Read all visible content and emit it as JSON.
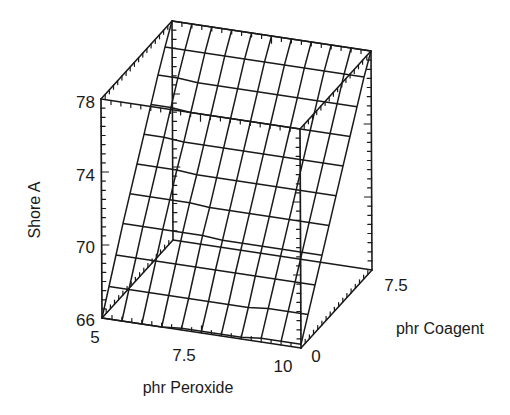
{
  "chart_data": {
    "type": "surface3d",
    "title": "",
    "xlabel": "phr Peroxide",
    "ylabel": "phr Coagent",
    "zlabel": "Shore A",
    "x_ticks": [
      "5",
      "7.5",
      "10"
    ],
    "y_ticks": [
      "0",
      "7.5"
    ],
    "z_ticks": [
      "66",
      "70",
      "74",
      "78"
    ],
    "xlim": [
      5,
      10
    ],
    "ylim": [
      0,
      8.5
    ],
    "zlim": [
      66,
      78
    ],
    "grid": {
      "nx": 10,
      "ny": 10
    },
    "x": [
      5.0,
      5.5,
      6.0,
      6.5,
      7.0,
      7.5,
      8.0,
      8.5,
      9.0,
      9.5,
      10.0
    ],
    "y": [
      0.0,
      0.85,
      1.7,
      2.55,
      3.4,
      4.25,
      5.1,
      5.95,
      6.8,
      7.65,
      8.5
    ],
    "z_description": "Shore A hardness surface; near-planar, rising from ~66 at coagent 0 to ~78 at max coagent, nearly flat across peroxide",
    "z_rows_by_coagent": [
      [
        66.0,
        66.0,
        66.0,
        66.0,
        66.1,
        66.1,
        66.1,
        66.1,
        66.2,
        66.2,
        66.2
      ],
      [
        67.3,
        67.3,
        67.3,
        67.3,
        67.3,
        67.3,
        67.3,
        67.3,
        67.4,
        67.4,
        67.4
      ],
      [
        68.6,
        68.6,
        68.6,
        68.6,
        68.6,
        68.6,
        68.6,
        68.6,
        68.6,
        68.6,
        68.6
      ],
      [
        69.9,
        69.9,
        69.9,
        69.9,
        69.9,
        69.8,
        69.8,
        69.8,
        69.8,
        69.8,
        69.8
      ],
      [
        71.1,
        71.1,
        71.1,
        71.1,
        71.0,
        71.0,
        71.0,
        71.0,
        71.0,
        71.0,
        71.0
      ],
      [
        72.3,
        72.3,
        72.3,
        72.2,
        72.2,
        72.2,
        72.2,
        72.2,
        72.2,
        72.2,
        72.2
      ],
      [
        73.5,
        73.5,
        73.4,
        73.4,
        73.4,
        73.4,
        73.4,
        73.4,
        73.4,
        73.4,
        73.4
      ],
      [
        74.7,
        74.7,
        74.6,
        74.6,
        74.6,
        74.6,
        74.6,
        74.6,
        74.6,
        74.6,
        74.6
      ],
      [
        75.9,
        75.9,
        75.8,
        75.8,
        75.8,
        75.8,
        75.8,
        75.8,
        75.8,
        75.8,
        75.8
      ],
      [
        77.0,
        77.0,
        77.0,
        77.0,
        77.0,
        77.0,
        77.0,
        77.0,
        77.0,
        77.0,
        77.0
      ],
      [
        78.0,
        78.0,
        78.0,
        78.0,
        78.0,
        78.0,
        78.0,
        78.0,
        78.0,
        78.0,
        78.0
      ]
    ],
    "box": true,
    "legend": null
  },
  "labels": {
    "z_axis_title": "Shore A",
    "x_axis_title": "phr Peroxide",
    "y_axis_title": "phr Coagent",
    "z_tick_0": "66",
    "z_tick_1": "70",
    "z_tick_2": "74",
    "z_tick_3": "78",
    "x_tick_0": "5",
    "x_tick_1": "7.5",
    "x_tick_2": "10",
    "y_tick_0": "0",
    "y_tick_1": "7.5"
  },
  "colors": {
    "line": "#1a1a1a",
    "background": "#ffffff"
  }
}
